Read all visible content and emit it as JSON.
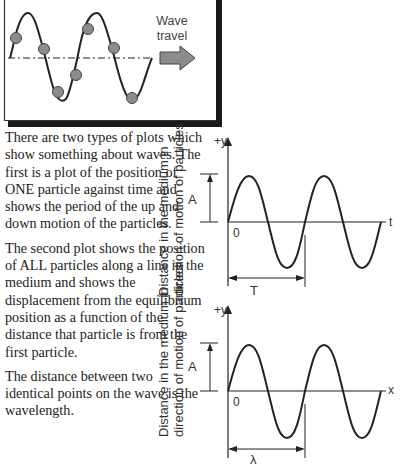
{
  "top_figure": {
    "label_line1": "Wave",
    "label_line2": "travel",
    "arrow_color": "#8c8c8c",
    "particle_color": "#8c8c8c",
    "particle_count": 7
  },
  "paragraphs": [
    "There are two types of plots which show something about waves. The first is a plot of the position of ONE particle against time and shows the period of the up and down motion of the particles.",
    "The second plot shows the position of ALL particles along a line in the medium and shows the displacement from the equilibrium position as a function of the distance that particle is from the first particle.",
    "The distance between two identical points on the wave is the wavelength."
  ],
  "graph_time": {
    "y_axis_label_line1": "Distance in the medium in",
    "y_axis_label_line2": "direction of motion of particles",
    "y_axis_tick": "+y",
    "x_axis_tick": "t",
    "origin_label": "0",
    "amplitude_label": "A",
    "span_label": "T"
  },
  "graph_space": {
    "y_axis_label_line1": "Distance in the medium in",
    "y_axis_label_line2": "direction of motion of particles",
    "y_axis_tick": "+y",
    "x_axis_tick": "x",
    "origin_label": "0",
    "amplitude_label": "A",
    "span_label": "λ"
  }
}
